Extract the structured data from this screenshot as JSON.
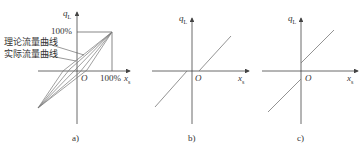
{
  "panels": [
    {
      "id": "a",
      "caption": "a)",
      "y_axis_label": "q",
      "y_axis_sub": "L",
      "x_axis_label": "x",
      "x_axis_sub": "s",
      "origin_label": "O",
      "y_tick": "100%",
      "x_tick": "100%",
      "curve_labels": [
        "理论流量曲线",
        "实际流量曲线"
      ]
    },
    {
      "id": "b",
      "caption": "b)",
      "y_axis_label": "q",
      "y_axis_sub": "L",
      "x_axis_label": "x",
      "x_axis_sub": "s",
      "origin_label": "O"
    },
    {
      "id": "c",
      "caption": "c)",
      "y_axis_label": "q",
      "y_axis_sub": "L",
      "x_axis_label": "x",
      "x_axis_sub": "s",
      "origin_label": "O"
    }
  ],
  "colors": {
    "axis": "#444444",
    "curve": "#777777"
  }
}
